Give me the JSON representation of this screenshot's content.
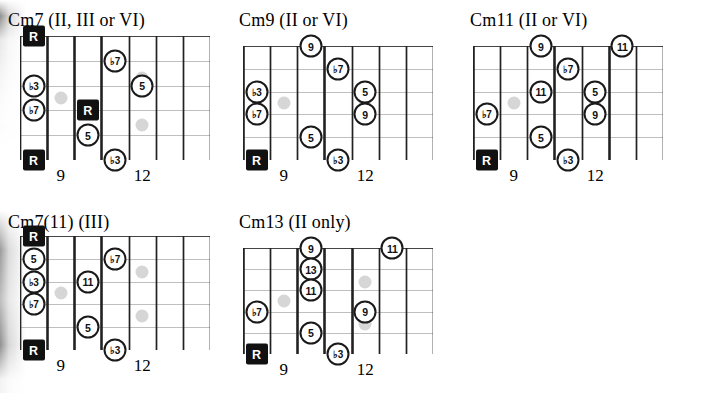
{
  "page": {
    "background": "#ffffff",
    "ink": "#111111",
    "ghost_color": "#cfcfcf",
    "width": 707,
    "height": 393
  },
  "legend": {
    "root_label": "R",
    "fret_marker_frets": [
      "9",
      "12"
    ]
  },
  "diagrams": [
    {
      "id": "cm7",
      "title": "Cm7 (II, III or VI)",
      "left": 8,
      "top": 10,
      "board_left": 20,
      "board_top": 36,
      "board_width": 190,
      "board_height": 124,
      "strings": 6,
      "frets": 7,
      "thick_fret_indices": [
        1,
        2,
        3
      ],
      "fret_numbers": [
        {
          "label": "9",
          "fret_slot": 1
        },
        {
          "label": "12",
          "fret_slot": 4
        }
      ],
      "notes": [
        {
          "label": "R",
          "type": "root",
          "string": 1,
          "fret_slot": 0
        },
        {
          "label": "♭3",
          "type": "open",
          "string": 3,
          "fret_slot": 0
        },
        {
          "label": "♭7",
          "type": "open",
          "string": 4,
          "fret_slot": 0
        },
        {
          "label": "R",
          "type": "root",
          "string": 6,
          "fret_slot": 0
        },
        {
          "label": "R",
          "type": "root",
          "string": 4,
          "fret_slot": 2
        },
        {
          "label": "5",
          "type": "open",
          "string": 5,
          "fret_slot": 2
        },
        {
          "label": "♭7",
          "type": "open",
          "string": 2,
          "fret_slot": 3
        },
        {
          "label": "♭3",
          "type": "open",
          "string": 6,
          "fret_slot": 3
        },
        {
          "label": "5",
          "type": "open",
          "string": 3,
          "fret_slot": 4
        }
      ],
      "ghosts": [
        {
          "string": 3.5,
          "fret_slot": 1,
          "shape": "dot"
        },
        {
          "string": 2.7,
          "fret_slot": 4,
          "shape": "dot"
        },
        {
          "string": 4.6,
          "fret_slot": 4,
          "shape": "dot"
        }
      ]
    },
    {
      "id": "cm9",
      "title": "Cm9 (II or VI)",
      "left": 239,
      "top": 10,
      "board_left": 243,
      "board_top": 46,
      "board_width": 190,
      "board_height": 114,
      "strings": 6,
      "frets": 7,
      "thick_fret_indices": [
        0,
        3
      ],
      "fret_numbers": [
        {
          "label": "9",
          "fret_slot": 1
        },
        {
          "label": "12",
          "fret_slot": 4
        }
      ],
      "notes": [
        {
          "label": "♭3",
          "type": "open",
          "string": 3,
          "fret_slot": 0
        },
        {
          "label": "♭7",
          "type": "open",
          "string": 4,
          "fret_slot": 0
        },
        {
          "label": "R",
          "type": "root",
          "string": 6,
          "fret_slot": 0
        },
        {
          "label": "9",
          "type": "open",
          "string": 1,
          "fret_slot": 2
        },
        {
          "label": "5",
          "type": "open",
          "string": 5,
          "fret_slot": 2
        },
        {
          "label": "♭7",
          "type": "open",
          "string": 2,
          "fret_slot": 3
        },
        {
          "label": "♭3",
          "type": "open",
          "string": 6,
          "fret_slot": 3
        },
        {
          "label": "5",
          "type": "open",
          "string": 3,
          "fret_slot": 4
        },
        {
          "label": "9",
          "type": "open",
          "string": 4,
          "fret_slot": 4
        }
      ],
      "ghosts": [
        {
          "string": 3.5,
          "fret_slot": 1,
          "shape": "dot"
        },
        {
          "string": 3.5,
          "fret_slot": 4,
          "shape": "tall"
        }
      ]
    },
    {
      "id": "cm11",
      "title": "Cm11 (II or VI)",
      "left": 470,
      "top": 10,
      "board_left": 473,
      "board_top": 46,
      "board_width": 190,
      "board_height": 114,
      "strings": 6,
      "frets": 7,
      "thick_fret_indices": [
        0,
        3,
        5
      ],
      "fret_numbers": [
        {
          "label": "9",
          "fret_slot": 1
        },
        {
          "label": "12",
          "fret_slot": 4
        }
      ],
      "notes": [
        {
          "label": "♭7",
          "type": "open",
          "string": 4,
          "fret_slot": 0
        },
        {
          "label": "R",
          "type": "root",
          "string": 6,
          "fret_slot": 0
        },
        {
          "label": "9",
          "type": "open",
          "string": 1,
          "fret_slot": 2
        },
        {
          "label": "11",
          "type": "open",
          "string": 3,
          "fret_slot": 2
        },
        {
          "label": "5",
          "type": "open",
          "string": 5,
          "fret_slot": 2
        },
        {
          "label": "♭7",
          "type": "open",
          "string": 2,
          "fret_slot": 3
        },
        {
          "label": "♭3",
          "type": "open",
          "string": 6,
          "fret_slot": 3
        },
        {
          "label": "5",
          "type": "open",
          "string": 3,
          "fret_slot": 4
        },
        {
          "label": "9",
          "type": "open",
          "string": 4,
          "fret_slot": 4
        },
        {
          "label": "11",
          "type": "open",
          "string": 1,
          "fret_slot": 5
        }
      ],
      "ghosts": [
        {
          "string": 3.5,
          "fret_slot": 1,
          "shape": "dot"
        },
        {
          "string": 3.5,
          "fret_slot": 4,
          "shape": "tall"
        }
      ]
    },
    {
      "id": "cm7-11",
      "title": "Cm7(11) (III)",
      "left": 8,
      "top": 212,
      "board_left": 20,
      "board_top": 236,
      "board_width": 190,
      "board_height": 114,
      "strings": 6,
      "frets": 7,
      "thick_fret_indices": [
        1,
        2,
        3
      ],
      "fret_numbers": [
        {
          "label": "9",
          "fret_slot": 1
        },
        {
          "label": "12",
          "fret_slot": 4
        }
      ],
      "notes": [
        {
          "label": "R",
          "type": "root",
          "string": 1,
          "fret_slot": 0
        },
        {
          "label": "5",
          "type": "open",
          "string": 2,
          "fret_slot": 0
        },
        {
          "label": "♭3",
          "type": "open",
          "string": 3,
          "fret_slot": 0
        },
        {
          "label": "♭7",
          "type": "open",
          "string": 4,
          "fret_slot": 0
        },
        {
          "label": "R",
          "type": "root",
          "string": 6,
          "fret_slot": 0
        },
        {
          "label": "11",
          "type": "open",
          "string": 3,
          "fret_slot": 2
        },
        {
          "label": "5",
          "type": "open",
          "string": 5,
          "fret_slot": 2
        },
        {
          "label": "♭7",
          "type": "open",
          "string": 2,
          "fret_slot": 3
        },
        {
          "label": "♭3",
          "type": "open",
          "string": 6,
          "fret_slot": 3
        }
      ],
      "ghosts": [
        {
          "string": 3.5,
          "fret_slot": 1,
          "shape": "dot"
        },
        {
          "string": 2.6,
          "fret_slot": 4,
          "shape": "dot"
        },
        {
          "string": 4.5,
          "fret_slot": 4,
          "shape": "dot"
        }
      ]
    },
    {
      "id": "cm13",
      "title": "Cm13 (II only)",
      "left": 239,
      "top": 212,
      "board_left": 243,
      "board_top": 248,
      "board_width": 190,
      "board_height": 106,
      "strings": 6,
      "frets": 7,
      "thick_fret_indices": [
        0,
        2,
        3,
        4
      ],
      "fret_numbers": [
        {
          "label": "9",
          "fret_slot": 1
        },
        {
          "label": "12",
          "fret_slot": 4
        }
      ],
      "notes": [
        {
          "label": "♭7",
          "type": "open",
          "string": 4,
          "fret_slot": 0
        },
        {
          "label": "R",
          "type": "root",
          "string": 6,
          "fret_slot": 0
        },
        {
          "label": "9",
          "type": "open",
          "string": 1,
          "fret_slot": 2
        },
        {
          "label": "13",
          "type": "open",
          "string": 2,
          "fret_slot": 2
        },
        {
          "label": "11",
          "type": "open",
          "string": 3,
          "fret_slot": 2
        },
        {
          "label": "5",
          "type": "open",
          "string": 5,
          "fret_slot": 2
        },
        {
          "label": "♭3",
          "type": "open",
          "string": 6,
          "fret_slot": 3
        },
        {
          "label": "9",
          "type": "open",
          "string": 4,
          "fret_slot": 4
        },
        {
          "label": "11",
          "type": "open",
          "string": 1,
          "fret_slot": 5
        }
      ],
      "ghosts": [
        {
          "string": 3.5,
          "fret_slot": 1,
          "shape": "dot"
        },
        {
          "string": 2.6,
          "fret_slot": 4,
          "shape": "dot"
        },
        {
          "string": 4.6,
          "fret_slot": 4,
          "shape": "dot"
        }
      ]
    }
  ]
}
